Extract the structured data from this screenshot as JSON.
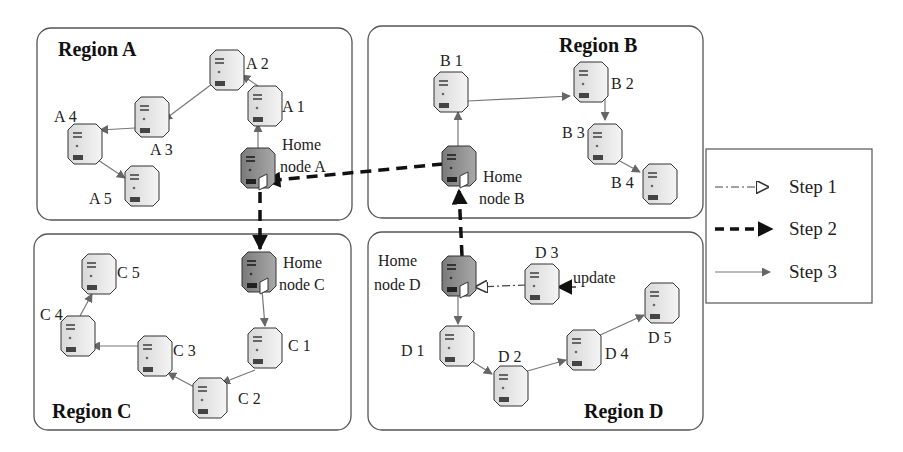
{
  "regions": [
    {
      "id": "A",
      "title": "Region A"
    },
    {
      "id": "B",
      "title": "Region B"
    },
    {
      "id": "C",
      "title": "Region C"
    },
    {
      "id": "D",
      "title": "Region D"
    }
  ],
  "nodes": {
    "A": {
      "home_line1": "Home",
      "home_line2": "node A",
      "nodes": [
        "A 1",
        "A 2",
        "A 3",
        "A 4",
        "A 5"
      ]
    },
    "B": {
      "home_line1": "Home",
      "home_line2": "node B",
      "nodes": [
        "B 1",
        "B 2",
        "B 3",
        "B 4"
      ]
    },
    "C": {
      "home_line1": "Home",
      "home_line2": "node C",
      "nodes": [
        "C 1",
        "C 2",
        "C 3",
        "C 4",
        "C 5"
      ]
    },
    "D": {
      "home_line1": "Home",
      "home_line2": "node D",
      "nodes": [
        "D 1",
        "D 2",
        "D 3",
        "D 4",
        "D 5"
      ]
    }
  },
  "annotations": {
    "update": "update"
  },
  "legend": {
    "items": [
      {
        "label": "Step 1",
        "style": "dash-dot line, hollow arrow"
      },
      {
        "label": "Step 2",
        "style": "thick dashed line, solid black arrow"
      },
      {
        "label": "Step 3",
        "style": "thin gray line, gray arrow"
      }
    ]
  },
  "edges": {
    "step1": [
      [
        "D 3",
        "Home node D"
      ]
    ],
    "step2": [
      [
        "Home node D",
        "Home node B"
      ],
      [
        "Home node B",
        "Home node A"
      ],
      [
        "Home node A",
        "Home node C"
      ]
    ],
    "step3": [
      [
        "Home node A",
        "A 1"
      ],
      [
        "A 1",
        "A 2"
      ],
      [
        "A 2",
        "A 3"
      ],
      [
        "A 3",
        "A 4"
      ],
      [
        "A 4",
        "A 5"
      ],
      [
        "Home node B",
        "B 1"
      ],
      [
        "B 1",
        "B 2"
      ],
      [
        "B 2",
        "B 3"
      ],
      [
        "B 3",
        "B 4"
      ],
      [
        "Home node C",
        "C 1"
      ],
      [
        "C 1",
        "C 2"
      ],
      [
        "C 2",
        "C 3"
      ],
      [
        "C 3",
        "C 4"
      ],
      [
        "C 4",
        "C 5"
      ],
      [
        "Home node D",
        "D 1"
      ],
      [
        "D 1",
        "D 2"
      ],
      [
        "D 2",
        "D 4"
      ],
      [
        "D 4",
        "D 5"
      ]
    ]
  }
}
